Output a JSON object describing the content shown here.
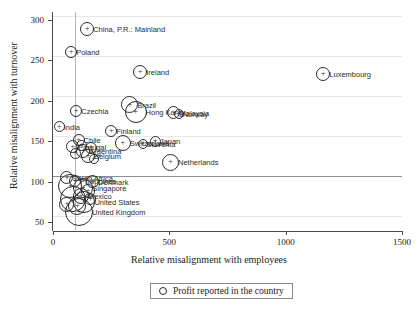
{
  "chart_data": {
    "type": "scatter",
    "title": "",
    "xlabel": "Relative misalignment with employees",
    "ylabel": "Relative misalignment with turnover",
    "xlim": [
      0,
      1500
    ],
    "ylim": [
      40,
      310
    ],
    "xticks": [
      0,
      500,
      1000,
      1500
    ],
    "yticks": [
      50,
      100,
      150,
      200,
      250,
      300
    ],
    "grid": true,
    "reference_lines": {
      "vertical_x": 95,
      "horizontal_y": 100
    },
    "legend": {
      "position": "bottom",
      "entries": [
        "Profit reported in the country"
      ]
    },
    "marker_style": "circle-with-plus, size proportional to profit reported",
    "points": [
      {
        "label": "China, P.R.: Mainland",
        "x": 147,
        "y": 289,
        "size": 14
      },
      {
        "label": "Poland",
        "x": 78,
        "y": 260,
        "size": 12
      },
      {
        "label": "Ireland",
        "x": 375,
        "y": 236,
        "size": 14
      },
      {
        "label": "Luxembourg",
        "x": 1162,
        "y": 233,
        "size": 14
      },
      {
        "label": "Brazil",
        "x": 330,
        "y": 195,
        "size": 17
      },
      {
        "label": "Hong Kong",
        "x": 355,
        "y": 186,
        "size": 22
      },
      {
        "label": "Malaysia",
        "x": 520,
        "y": 185,
        "size": 13
      },
      {
        "label": "Norway",
        "x": 540,
        "y": 184,
        "size": 10
      },
      {
        "label": "Czechia",
        "x": 100,
        "y": 187,
        "size": 12
      },
      {
        "label": "India",
        "x": 27,
        "y": 168,
        "size": 11
      },
      {
        "label": "Finland",
        "x": 250,
        "y": 163,
        "size": 12
      },
      {
        "label": "Chile",
        "x": 110,
        "y": 152,
        "size": 12
      },
      {
        "label": "Switzerland",
        "x": 300,
        "y": 148,
        "size": 16
      },
      {
        "label": "Japan",
        "x": 440,
        "y": 150,
        "size": 11
      },
      {
        "label": "Slovenia",
        "x": 385,
        "y": 146,
        "size": 10
      },
      {
        "label": "Portugal",
        "x": 85,
        "y": 143,
        "size": 13
      },
      {
        "label": "Argentina",
        "x": 130,
        "y": 138,
        "size": 14
      },
      {
        "label": "Belgium",
        "x": 150,
        "y": 132,
        "size": 14
      },
      {
        "label": "Netherlands",
        "x": 505,
        "y": 124,
        "size": 17
      },
      {
        "label": "South Africa",
        "x": 60,
        "y": 105,
        "size": 13
      },
      {
        "label": "Philippines",
        "x": 95,
        "y": 101,
        "size": 12
      },
      {
        "label": "Denmark",
        "x": 170,
        "y": 100,
        "size": 13
      },
      {
        "label": "Singapore",
        "x": 130,
        "y": 92,
        "size": 20
      },
      {
        "label": "Mexico",
        "x": 120,
        "y": 82,
        "size": 16
      },
      {
        "label": "United States",
        "x": 135,
        "y": 75,
        "size": 22
      },
      {
        "label": "United Kingdom",
        "x": 112,
        "y": 62,
        "size": 28
      },
      {
        "label": "",
        "x": 75,
        "y": 95,
        "size": 24
      },
      {
        "label": "",
        "x": 88,
        "y": 78,
        "size": 26
      },
      {
        "label": "",
        "x": 105,
        "y": 70,
        "size": 18
      },
      {
        "label": "",
        "x": 150,
        "y": 88,
        "size": 14
      },
      {
        "label": "",
        "x": 160,
        "y": 78,
        "size": 12
      },
      {
        "label": "",
        "x": 60,
        "y": 72,
        "size": 15
      },
      {
        "label": "",
        "x": 122,
        "y": 145,
        "size": 11
      },
      {
        "label": "",
        "x": 165,
        "y": 142,
        "size": 12
      },
      {
        "label": "",
        "x": 95,
        "y": 135,
        "size": 11
      },
      {
        "label": "",
        "x": 175,
        "y": 128,
        "size": 10
      }
    ]
  }
}
